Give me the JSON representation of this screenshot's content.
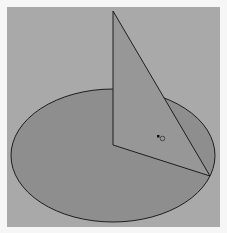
{
  "figure": {
    "colors": {
      "frame": "#f6f6f6",
      "canvas": "#a9a9a9",
      "disc_fill": "#8e8e8e",
      "triangle_fill": "#979797",
      "stroke": "#1e1e1e"
    },
    "disc": {
      "cx": 113,
      "cy": 155.5,
      "rx": 102,
      "ry": 66.5
    },
    "triangle": {
      "apex": [
        113,
        11
      ],
      "center": [
        113,
        145
      ],
      "rim_point": [
        210,
        176
      ]
    },
    "cursor": {
      "x": 157,
      "y": 135
    }
  }
}
